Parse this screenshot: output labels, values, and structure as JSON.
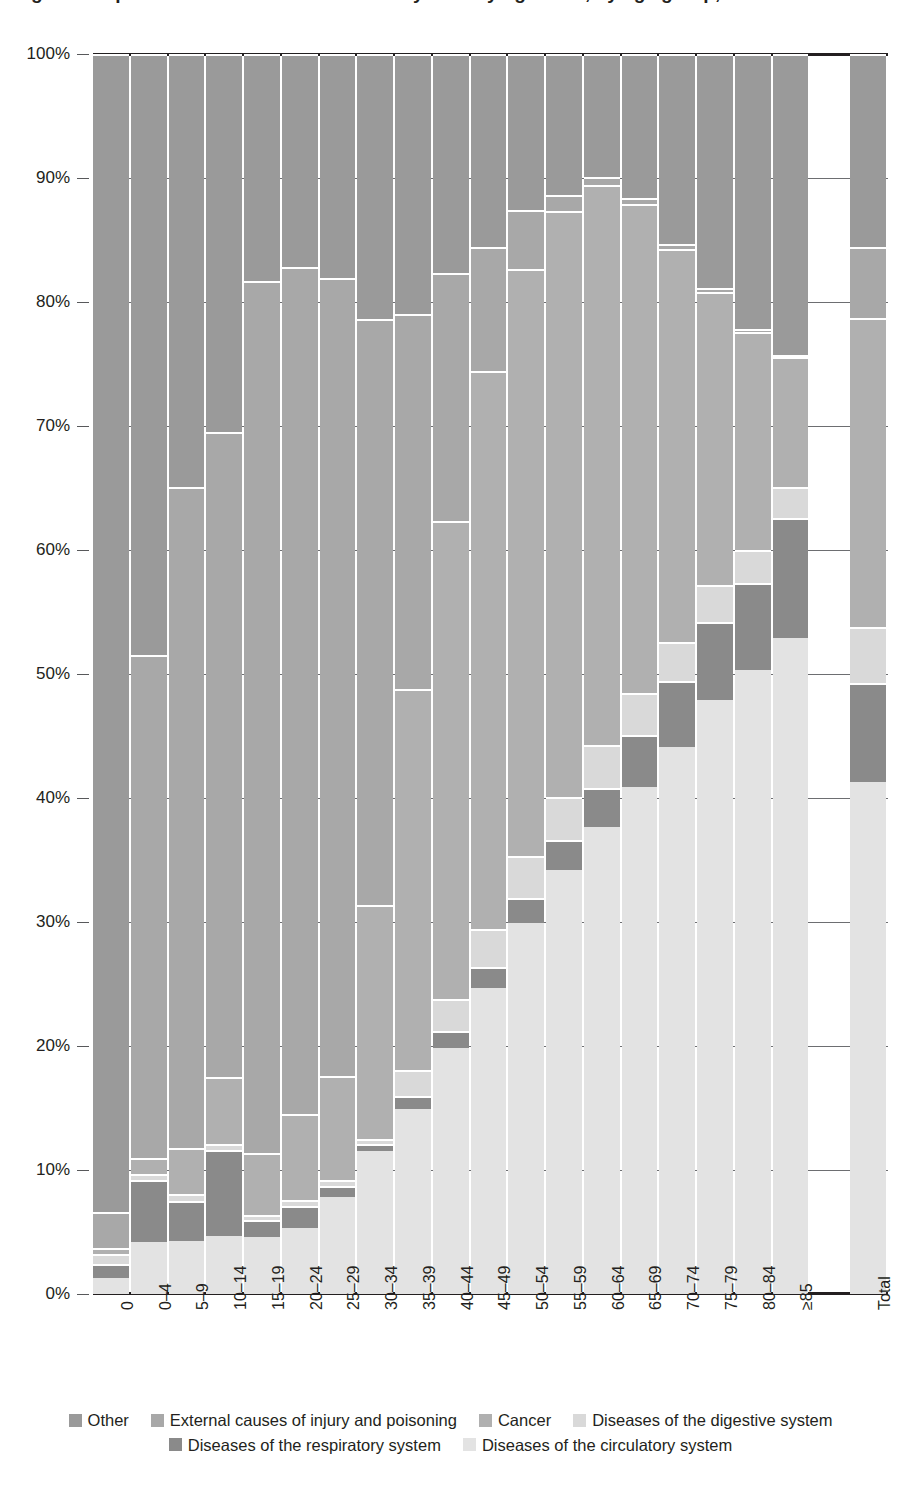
{
  "title": "Figure: Proportional distribution of deaths by underlying cause, by age group, 2015",
  "axes": {
    "y_ticks": [
      "0%",
      "10%",
      "20%",
      "30%",
      "40%",
      "50%",
      "60%",
      "70%",
      "80%",
      "90%",
      "100%"
    ],
    "y_min": 0,
    "y_max": 100,
    "x_labels": [
      "0",
      "0–4",
      "5–9",
      "10–14",
      "15–19",
      "20–24",
      "25–29",
      "30–34",
      "35–39",
      "40–44",
      "45–49",
      "50–54",
      "55–59",
      "60–64",
      "65–69",
      "70–74",
      "75–79",
      "80–84",
      "≥85",
      "Total"
    ]
  },
  "legend": {
    "rows": [
      [
        {
          "label": "Other",
          "color": "#9a9a9a"
        },
        {
          "label": "External causes of injury and poisoning",
          "color": "#a8a8a8"
        },
        {
          "label": "Cancer",
          "color": "#b0b0b0"
        },
        {
          "label": "Diseases of the digestive system",
          "color": "#d9d9d9"
        }
      ],
      [
        {
          "label": "Diseases of the respiratory system",
          "color": "#8a8a8a"
        },
        {
          "label": "Diseases of the circulatory system",
          "color": "#e3e3e3"
        }
      ]
    ]
  },
  "chart_data": {
    "type": "bar",
    "subtype": "stacked-100-percent",
    "title": "Figure: Proportional distribution of deaths by underlying cause, by age group, 2015",
    "xlabel": "",
    "ylabel": "",
    "ylim": [
      0,
      100
    ],
    "grid": true,
    "legend_position": "bottom",
    "stack_order_bottom_to_top": [
      "Diseases of the circulatory system",
      "Diseases of the respiratory system",
      "Diseases of the digestive system",
      "Cancer",
      "External causes of injury and poisoning",
      "Other"
    ],
    "categories": [
      "0",
      "0–4",
      "5–9",
      "10–14",
      "15–19",
      "20–24",
      "25–29",
      "30–34",
      "35–39",
      "40–44",
      "45–49",
      "50–54",
      "55–59",
      "60–64",
      "65–69",
      "70–74",
      "75–79",
      "80–84",
      "≥85",
      "Total"
    ],
    "series": [
      {
        "name": "Diseases of the circulatory system",
        "color": "#e3e3e3",
        "values": [
          1.3,
          4.2,
          4.3,
          4.7,
          4.6,
          5.3,
          7.8,
          11.5,
          14.9,
          19.8,
          24.7,
          29.9,
          34.2,
          37.7,
          40.9,
          44.1,
          47.9,
          50.3,
          52.9,
          41.3
        ]
      },
      {
        "name": "Diseases of the respiratory system",
        "color": "#8a8a8a",
        "values": [
          1.1,
          5.0,
          3.2,
          6.9,
          1.4,
          1.8,
          0.9,
          0.6,
          1.1,
          1.4,
          1.7,
          2.0,
          2.4,
          3.1,
          4.2,
          5.3,
          6.3,
          7.0,
          9.7,
          8.0
        ]
      },
      {
        "name": "Diseases of the digestive system",
        "color": "#d9d9d9",
        "values": [
          0.8,
          0.5,
          0.6,
          0.5,
          0.4,
          0.5,
          0.5,
          0.4,
          2.1,
          2.6,
          3.0,
          3.4,
          3.5,
          3.5,
          3.4,
          3.2,
          3.0,
          2.7,
          2.5,
          4.5
        ]
      },
      {
        "name": "Cancer",
        "color": "#b0b0b0",
        "values": [
          0.5,
          1.3,
          3.7,
          5.4,
          5.0,
          6.9,
          8.4,
          18.9,
          30.7,
          38.5,
          45.0,
          47.4,
          47.2,
          45.1,
          39.4,
          31.7,
          23.6,
          17.6,
          10.5,
          24.9
        ]
      },
      {
        "name": "External causes of injury and poisoning",
        "color": "#a8a8a8",
        "values": [
          2.9,
          40.5,
          53.3,
          52.0,
          70.3,
          68.3,
          64.3,
          47.2,
          30.2,
          20.0,
          10.0,
          4.7,
          1.3,
          0.7,
          0.5,
          0.4,
          0.3,
          0.2,
          0.1,
          5.7
        ]
      },
      {
        "name": "Other",
        "color": "#9a9a9a",
        "values": [
          93.4,
          48.5,
          34.9,
          30.5,
          18.3,
          17.2,
          18.1,
          21.4,
          21.0,
          17.7,
          15.6,
          12.6,
          11.4,
          9.9,
          11.6,
          15.3,
          18.9,
          22.2,
          24.3,
          15.6
        ]
      }
    ],
    "totals_column": {
      "label": "Total",
      "breakpoints_percent": {
        "circulatory": 41.3,
        "respiratory": 49.3,
        "digestive": 53.8,
        "cancer": 78.7,
        "external": 84.4,
        "other": 100.0
      }
    }
  },
  "layout": {
    "plot_left_px": 93,
    "plot_top_px": 54,
    "plot_width_px": 795,
    "plot_height_px": 1240,
    "bar_count": 19,
    "gap_before_total_px": 40
  }
}
